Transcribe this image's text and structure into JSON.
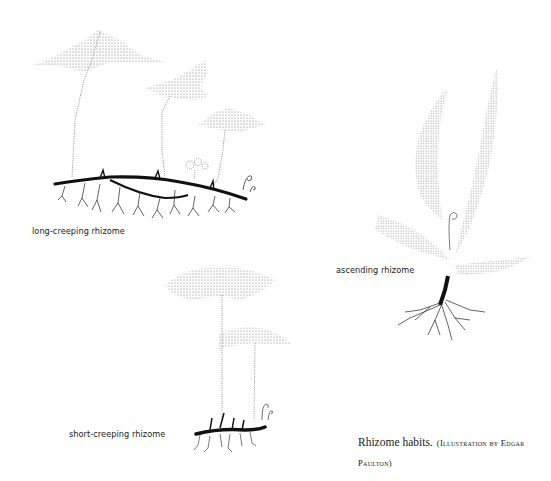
{
  "figure": {
    "labels": {
      "long_creeping": "long-creeping rhizome",
      "ascending": "ascending rhizome",
      "short_creeping": "short-creeping rhizome"
    },
    "caption": {
      "main": "Rhizome habits.",
      "credit_open": "(Illustration by Edgar",
      "credit_close": "Paulton)"
    },
    "ink_color": "#1a1a1a",
    "stipple_color": "#555555"
  }
}
